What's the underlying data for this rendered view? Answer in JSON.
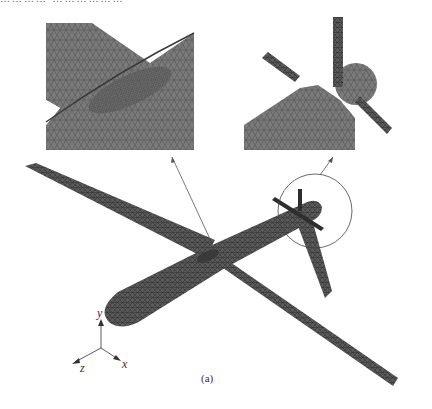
{
  "figure": {
    "top_text_fragment": "………… ………………",
    "caption": "(a)",
    "insets": [
      {
        "name": "wing-root-detail",
        "description": "Zoomed mesh at wing-fuselage junction"
      },
      {
        "name": "propeller-detail",
        "description": "Zoomed mesh of rear propeller and hub"
      }
    ],
    "axes": {
      "x": "x",
      "y": "y",
      "z": "z"
    },
    "colors": {
      "mesh_fill": "#6e6e6e",
      "mesh_dark": "#3c3c3c",
      "mesh_line": "#4a4a4a",
      "leader_line": "#555555",
      "background": "#ffffff"
    }
  }
}
